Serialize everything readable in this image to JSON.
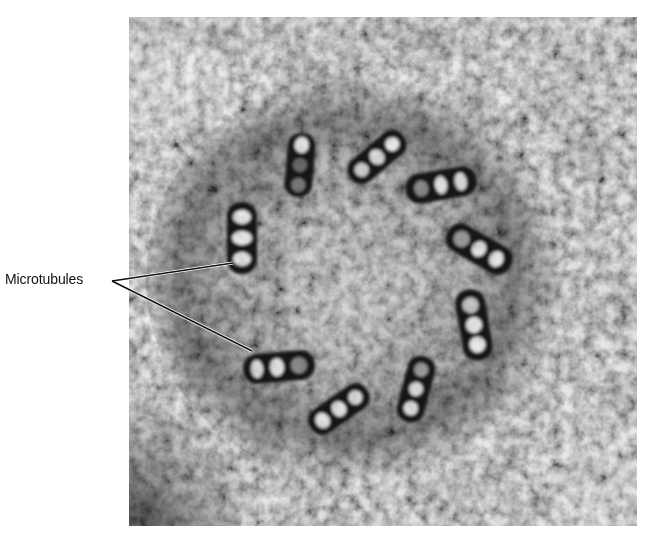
{
  "figure": {
    "label": "Microtubules",
    "image_description": "Electron micrograph cross-section of a centriole showing nine microtubule triplets arranged in a ring",
    "colors": {
      "background": "#ffffff",
      "micrograph_base": "#9a9a9a",
      "micrograph_light": "#d8d8d8",
      "micrograph_dark": "#1a1a1a",
      "label_text": "#111111",
      "leader_line": "#111111"
    }
  }
}
